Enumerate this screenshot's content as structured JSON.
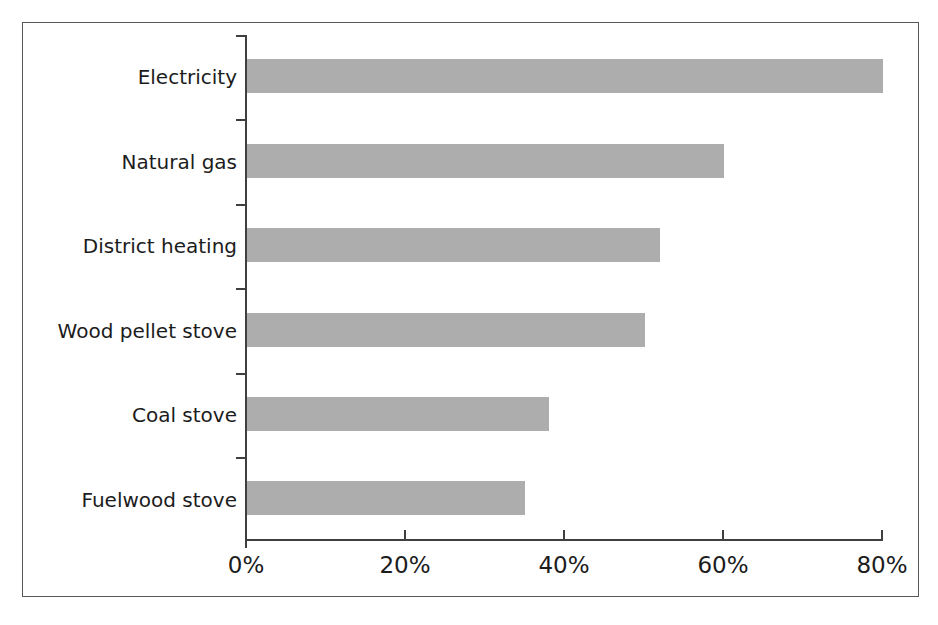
{
  "chart_data": {
    "type": "bar",
    "orientation": "horizontal",
    "title": "",
    "subtitle": "",
    "xlabel": "",
    "ylabel": "",
    "categories": [
      "Electricity",
      "Natural gas",
      "District heating",
      "Wood pellet stove",
      "Coal stove",
      "Fuelwood stove"
    ],
    "values": [
      80,
      60,
      52,
      50,
      38,
      35
    ],
    "value_unit": "%",
    "xlim": [
      0,
      80
    ],
    "xticks": [
      0,
      20,
      40,
      60,
      80
    ],
    "xtick_labels": [
      "0%",
      "20%",
      "40%",
      "60%",
      "80%"
    ],
    "grid": false,
    "legend": null,
    "legend_position": "none",
    "series": [
      {
        "name": "Share",
        "values": [
          80,
          60,
          52,
          50,
          38,
          35
        ]
      }
    ],
    "colors": {
      "bar_fill": "#adadad",
      "axis": "#3f3f3f",
      "frame": "#595959",
      "text": "#1c1c1c",
      "background": "#ffffff"
    }
  },
  "axis": {
    "x_tick_labels": [
      "0%",
      "20%",
      "40%",
      "60%",
      "80%"
    ],
    "category_labels": [
      "Electricity",
      "Natural gas",
      "District heating",
      "Wood pellet stove",
      "Coal stove",
      "Fuelwood stove"
    ]
  }
}
